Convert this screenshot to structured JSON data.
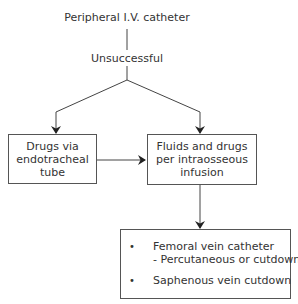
{
  "diagram": {
    "start": "Peripheral I.V. catheter",
    "condition": "Unsuccessful",
    "left_box": "Drugs via\nendotracheal\ntube",
    "right_box": "Fluids and drugs\nper intraosseous\ninfusion",
    "bottom_box": {
      "items": [
        {
          "bullet": "•",
          "line1": "Femoral vein catheter",
          "line2": "- Percutaneous or cutdown"
        },
        {
          "bullet": "•",
          "line1": "Saphenous vein cutdown",
          "line2": ""
        }
      ]
    },
    "colors": {
      "line": "#444444",
      "text": "#333333"
    }
  }
}
